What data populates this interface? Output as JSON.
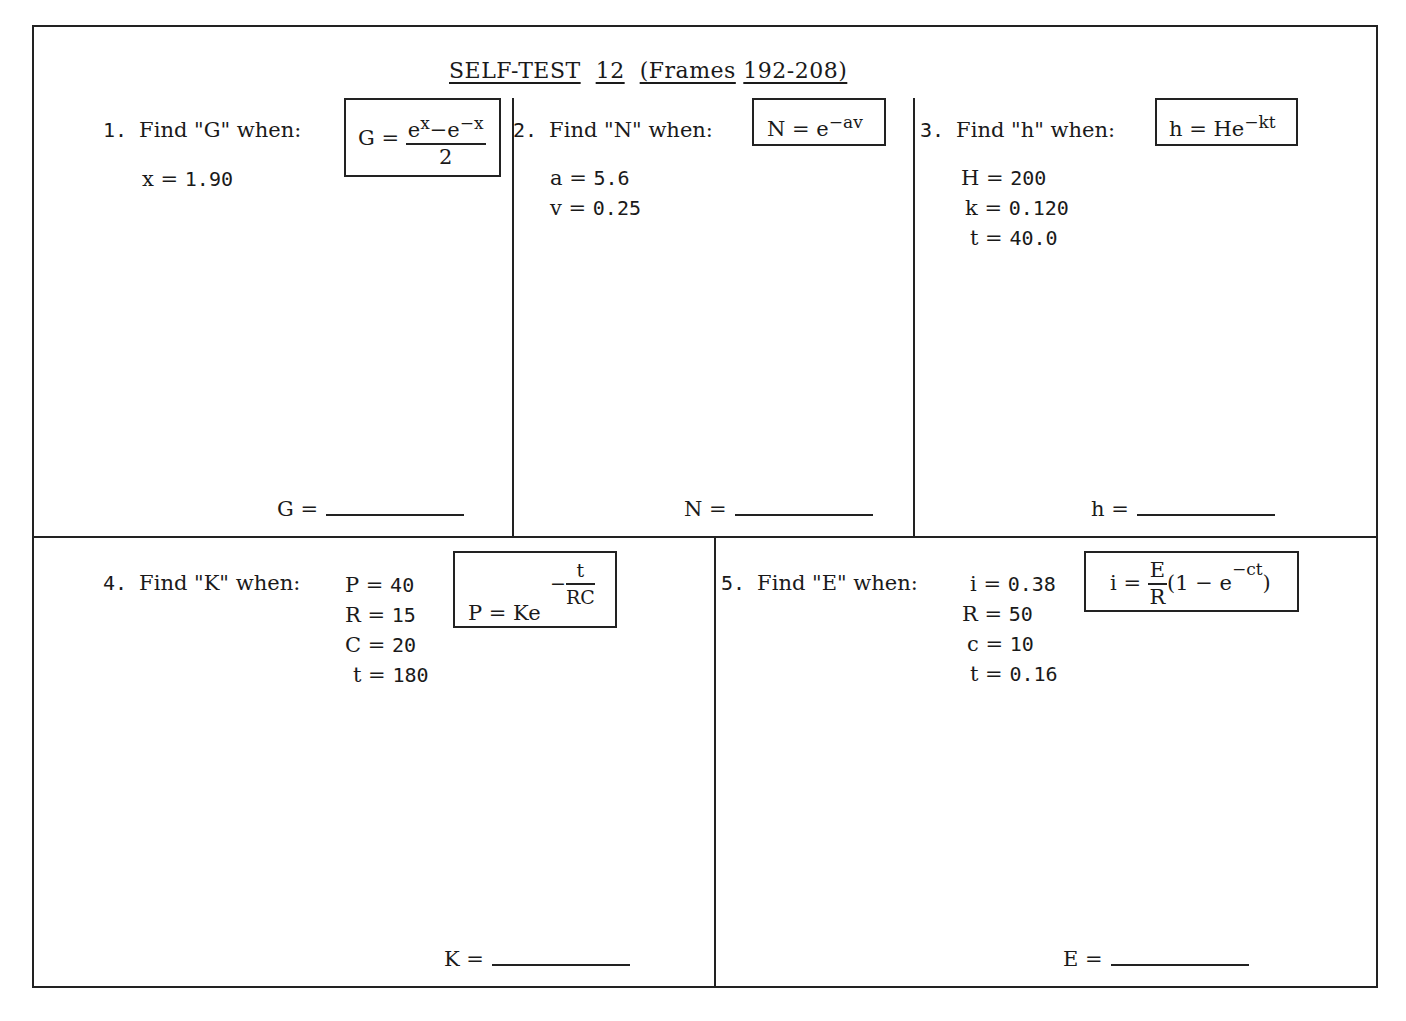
{
  "title": {
    "parts": [
      "SELF-TEST",
      "12",
      "(Frames",
      "192-208)"
    ],
    "full": "SELF-TEST 12 (Frames 192-208)"
  },
  "problems": [
    {
      "number": "1.",
      "prompt": "Find \"G\" when:",
      "formula": {
        "lhs": "G =",
        "numerator": "eˣ−e⁻ˣ",
        "numerator_base1": "e",
        "numerator_exp1": "x",
        "numerator_mid": "−e",
        "numerator_exp2": "−x",
        "denominator": "2",
        "text": "G = (e^x − e^−x)/2"
      },
      "givens": [
        {
          "label": "x =",
          "value": "1.90"
        }
      ],
      "answer": {
        "label": "G =",
        "value": ""
      }
    },
    {
      "number": "2.",
      "prompt": "Find \"N\" when:",
      "formula": {
        "lhs": "N = e",
        "exponent": "−av",
        "text": "N = e^−av"
      },
      "givens": [
        {
          "label": "a =",
          "value": "5.6"
        },
        {
          "label": "v =",
          "value": "0.25"
        }
      ],
      "answer": {
        "label": "N =",
        "value": ""
      }
    },
    {
      "number": "3.",
      "prompt": "Find \"h\" when:",
      "formula": {
        "lhs": "h = He",
        "exponent": "−kt",
        "text": "h = He^−kt"
      },
      "givens": [
        {
          "label": "H =",
          "value": "200"
        },
        {
          "label": "k =",
          "value": "0.120"
        },
        {
          "label": "t =",
          "value": "40.0"
        }
      ],
      "answer": {
        "label": "h =",
        "value": ""
      }
    },
    {
      "number": "4.",
      "prompt": "Find \"K\" when:",
      "formula": {
        "lhs": "P = Ke",
        "exp_sign": "−",
        "exp_numerator": "t",
        "exp_denominator": "RC",
        "text": "P = Ke^−(t/RC)"
      },
      "givens": [
        {
          "label": "P =",
          "value": "40"
        },
        {
          "label": "R =",
          "value": "15"
        },
        {
          "label": "C =",
          "value": "20"
        },
        {
          "label": "t =",
          "value": "180"
        }
      ],
      "answer": {
        "label": "K =",
        "value": ""
      }
    },
    {
      "number": "5.",
      "prompt": "Find \"E\" when:",
      "formula": {
        "lhs": "i =",
        "frac_numerator": "E",
        "frac_denominator": "R",
        "paren_open": "(1 − e",
        "exponent": "−ct",
        "paren_close": ")",
        "text": "i = (E/R)(1 − e^−ct)"
      },
      "givens": [
        {
          "label": "i =",
          "value": "0.38"
        },
        {
          "label": "R =",
          "value": "50"
        },
        {
          "label": "c =",
          "value": "10"
        },
        {
          "label": "t =",
          "value": "0.16"
        }
      ],
      "answer": {
        "label": "E =",
        "value": ""
      }
    }
  ]
}
